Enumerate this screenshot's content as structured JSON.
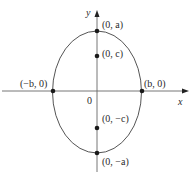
{
  "diagram": {
    "axes": {
      "x_label": "x",
      "y_label": "y",
      "origin_label": "0"
    },
    "points": [
      {
        "id": "top_vertex",
        "label": "(0, a)"
      },
      {
        "id": "top_focus",
        "label": "(0, c)"
      },
      {
        "id": "left_covertex",
        "label": "(−b, 0)"
      },
      {
        "id": "right_covertex",
        "label": "(b, 0)"
      },
      {
        "id": "bottom_focus",
        "label": "(0, −c)"
      },
      {
        "id": "bottom_vertex",
        "label": "(0, −a)"
      }
    ],
    "colors": {
      "stroke": "#555555",
      "point": "#1a1a1a",
      "text": "#2a2a2a"
    }
  }
}
